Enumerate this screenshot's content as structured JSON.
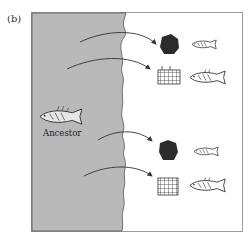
{
  "panel": {
    "label": "(b)"
  },
  "diagram": {
    "ancestor_label": "Ancestor",
    "colors": {
      "water": "#b9b9b9",
      "land": "#ffffff",
      "ink": "#333333",
      "border": "#9a9a9a"
    },
    "descendants": [
      {
        "habitat": "rock",
        "fish_size": "small"
      },
      {
        "habitat": "vegetation-grid",
        "fish_size": "large"
      },
      {
        "habitat": "rock",
        "fish_size": "small"
      },
      {
        "habitat": "vegetation-grid",
        "fish_size": "large"
      }
    ]
  }
}
